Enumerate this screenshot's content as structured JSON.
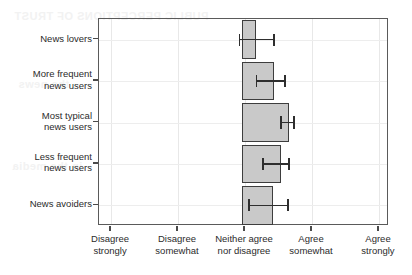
{
  "chart_data": {
    "type": "bar",
    "orientation": "horizontal",
    "title": "",
    "subtitle": "",
    "xlabel": "",
    "ylabel": "",
    "grid": true,
    "legend": null,
    "categories": [
      "News lovers",
      "More frequent\nnews users",
      "Most typical\nnews users",
      "Less frequent\nnews users",
      "News avoiders"
    ],
    "xtick_labels": [
      "Disagree\nstrongly",
      "Disagree\nsomewhat",
      "Neither agree\nnor disagree",
      "Agree\nsomewhat",
      "Agree\nstrongly"
    ],
    "xtick_values": [
      1,
      2,
      3,
      4,
      5
    ],
    "xlim": [
      0.82,
      5.15
    ],
    "bar_start_value": 2.96,
    "bars": [
      {
        "category": "News lovers",
        "start": 2.96,
        "end": 3.17,
        "mean": 3.02,
        "ci_low": 2.92,
        "ci_high": 3.43
      },
      {
        "category": "More frequent news users",
        "start": 2.96,
        "end": 3.43,
        "mean": 3.18,
        "ci_low": 3.17,
        "ci_high": 3.6
      },
      {
        "category": "Most typical news users",
        "start": 2.96,
        "end": 3.66,
        "mean": 3.57,
        "ci_low": 3.54,
        "ci_high": 3.73
      },
      {
        "category": "Less frequent news users",
        "start": 2.96,
        "end": 3.54,
        "mean": 3.31,
        "ci_low": 3.27,
        "ci_high": 3.66
      },
      {
        "category": "News avoiders",
        "start": 2.96,
        "end": 3.42,
        "mean": 3.11,
        "ci_low": 3.06,
        "ci_high": 3.64
      }
    ],
    "colors": {
      "bar_fill": "#c9c9c9",
      "bar_border": "#3d3d3d",
      "error_bar": "#2e2e2e",
      "axis": "#5a5a5a",
      "grid": "#e8e8e8",
      "text": "#2b2b2b",
      "background": "#ffffff"
    }
  },
  "ghost_text": {
    "line1": "PUBLIC PERCEPTIONS OF TRUST",
    "line2": "the news",
    "line3": "in the media"
  }
}
